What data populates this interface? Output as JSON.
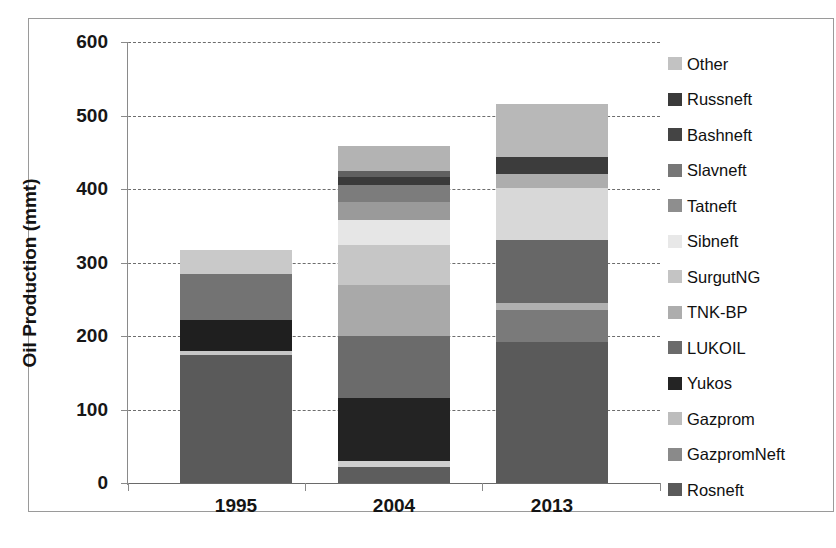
{
  "chart_data": {
    "type": "bar",
    "subtype": "stacked-vertical",
    "title": "",
    "xlabel": "",
    "ylabel": "Oil Production (mmt)",
    "ylim": [
      0,
      600
    ],
    "yticks": [
      0,
      100,
      200,
      300,
      400,
      500,
      600
    ],
    "ytick_labels": [
      "0",
      "100",
      "200",
      "300",
      "400",
      "500",
      "600"
    ],
    "grid": true,
    "grid_style": "dashed-horizontal",
    "legend_position": "right",
    "categories": [
      "1995",
      "2004",
      "2013"
    ],
    "stack_order_bottom_to_top": [
      "Rosneft",
      "GazpromNeft",
      "Gazprom",
      "Yukos",
      "LUKOIL",
      "TNK-BP",
      "SurgutNG",
      "Sibneft",
      "Tatneft",
      "Slavneft",
      "Bashneft",
      "Russneft",
      "Other"
    ],
    "series": [
      {
        "name": "Rosneft",
        "color": "#5a5a5a",
        "values": [
          174,
          22,
          192
        ]
      },
      {
        "name": "GazpromNeft",
        "color": "#9f9f9f",
        "values": [
          5,
          8,
          0
        ]
      },
      {
        "name": "Gazprom",
        "color": "#c9c9c9",
        "values": [
          0,
          0,
          0
        ]
      },
      {
        "name": "Yukos",
        "color": "#232323",
        "values": [
          43,
          86,
          0
        ]
      },
      {
        "name": "LUKOIL",
        "color": "#6f6f6f",
        "values": [
          0,
          0,
          80
        ]
      },
      {
        "name": "TNK-BP",
        "color": "#a8a8a8",
        "values": [
          0,
          0,
          10
        ]
      },
      {
        "name": "SurgutNG",
        "color": "#919191",
        "values": [
          0,
          74,
          0
        ]
      },
      {
        "name": "Sibneft",
        "color": "#e3e3e3",
        "values": [
          0,
          0,
          0
        ]
      },
      {
        "name": "Tatneft",
        "color": "#8c8c8c",
        "values": [
          62,
          0,
          0
        ]
      },
      {
        "name": "Slavneft",
        "color": "#7d7d7d",
        "values": [
          0,
          0,
          0
        ]
      },
      {
        "name": "Bashneft",
        "color": "#4a4a4a",
        "values": [
          0,
          0,
          0
        ]
      },
      {
        "name": "Russneft",
        "color": "#2e2e2e",
        "values": [
          0,
          0,
          0
        ]
      },
      {
        "name": "Other",
        "color": "#c2c2c2",
        "values": [
          33,
          0,
          0
        ]
      }
    ],
    "stacks": {
      "1995": [
        {
          "name": "Rosneft",
          "value": 174,
          "color": "#5a5a5a"
        },
        {
          "name": "GazpromNeft",
          "value": 5,
          "color": "#c6c6c6"
        },
        {
          "name": "Yukos",
          "value": 43,
          "color": "#1f1f1f"
        },
        {
          "name": "LUKOIL",
          "value": 62,
          "color": "#737373"
        },
        {
          "name": "Other",
          "value": 33,
          "color": "#c9c9c9"
        }
      ],
      "2004": [
        {
          "name": "Rosneft",
          "value": 22,
          "color": "#5d5d5d"
        },
        {
          "name": "GazpromNeft",
          "value": 8,
          "color": "#cfcfcf"
        },
        {
          "name": "Yukos",
          "value": 86,
          "color": "#232323"
        },
        {
          "name": "LUKOIL",
          "value": 84,
          "color": "#6b6b6b"
        },
        {
          "name": "TNK-BP",
          "value": 70,
          "color": "#a9a9a9"
        },
        {
          "name": "SurgutNG",
          "value": 54,
          "color": "#c6c6c6"
        },
        {
          "name": "Sibneft",
          "value": 34,
          "color": "#e6e6e6"
        },
        {
          "name": "Tatneft",
          "value": 25,
          "color": "#9a9a9a"
        },
        {
          "name": "Slavneft",
          "value": 22,
          "color": "#7c7c7c"
        },
        {
          "name": "Bashneft",
          "value": 12,
          "color": "#3a3a3a"
        },
        {
          "name": "Russneft",
          "value": 8,
          "color": "#606060"
        },
        {
          "name": "Other",
          "value": 34,
          "color": "#b3b3b3"
        }
      ],
      "2013": [
        {
          "name": "Rosneft",
          "value": 192,
          "color": "#5a5a5a"
        },
        {
          "name": "GazpromNeft",
          "value": 43,
          "color": "#7a7a7a"
        },
        {
          "name": "Gazprom",
          "value": 10,
          "color": "#b0b0b0"
        },
        {
          "name": "LUKOIL",
          "value": 86,
          "color": "#676767"
        },
        {
          "name": "TNK-BP",
          "value": 70,
          "color": "#d8d8d8"
        },
        {
          "name": "SurgutNG",
          "value": 20,
          "color": "#adadad"
        },
        {
          "name": "Bashneft",
          "value": 22,
          "color": "#3c3c3c"
        },
        {
          "name": "Other",
          "value": 73,
          "color": "#b8b8b8"
        }
      ]
    },
    "totals": {
      "1995": 317,
      "2004": 459,
      "2013": 516
    }
  },
  "legend": {
    "items": [
      {
        "label": "Other",
        "color": "#c2c2c2"
      },
      {
        "label": "Russneft",
        "color": "#3a3a3a"
      },
      {
        "label": "Bashneft",
        "color": "#444444"
      },
      {
        "label": "Slavneft",
        "color": "#777777"
      },
      {
        "label": "Tatneft",
        "color": "#8e8e8e"
      },
      {
        "label": "Sibneft",
        "color": "#e8e8e8"
      },
      {
        "label": "SurgutNG",
        "color": "#c4c4c4"
      },
      {
        "label": "TNK-BP",
        "color": "#adadad"
      },
      {
        "label": "LUKOIL",
        "color": "#6b6b6b"
      },
      {
        "label": "Yukos",
        "color": "#242424"
      },
      {
        "label": "Gazprom",
        "color": "#bdbdbd"
      },
      {
        "label": "GazpromNeft",
        "color": "#8a8a8a"
      },
      {
        "label": "Rosneft",
        "color": "#5a5a5a"
      }
    ]
  },
  "axis": {
    "y_title": "Oil Production (mmt)",
    "y_ticks": [
      "600",
      "500",
      "400",
      "300",
      "200",
      "100",
      "0"
    ],
    "x_ticks": [
      "1995",
      "2004",
      "2013"
    ]
  }
}
